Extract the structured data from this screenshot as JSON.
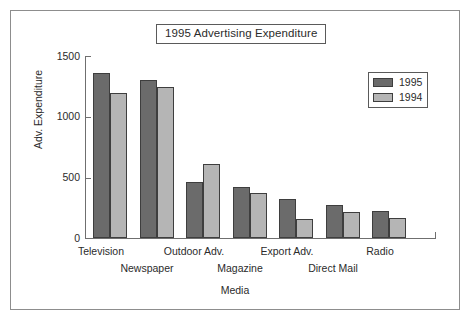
{
  "title": "1995 Advertising Expenditure",
  "legend": {
    "position": "top-right",
    "items": [
      {
        "label": "1995",
        "color": "#6b6b6b"
      },
      {
        "label": "1994",
        "color": "#b5b5b5"
      }
    ]
  },
  "axes": {
    "ylabel": "Adv. Expenditure",
    "xlabel": "Media",
    "yticks": [
      "0",
      "500",
      "1000",
      "1500"
    ]
  },
  "chart_data": {
    "type": "bar",
    "title": "1995 Advertising Expenditure",
    "xlabel": "Media",
    "ylabel": "Adv. Expenditure",
    "ylim": [
      0,
      1500
    ],
    "yticks": [
      0,
      500,
      1000,
      1500
    ],
    "grid": false,
    "legend_position": "top-right",
    "categories": [
      "Television",
      "Newspaper",
      "Outdoor Adv.",
      "Magazine",
      "Export Adv.",
      "Direct Mail",
      "Radio"
    ],
    "series": [
      {
        "name": "1995",
        "color": "#6b6b6b",
        "values": [
          1365,
          1310,
          465,
          420,
          320,
          275,
          225
        ]
      },
      {
        "name": "1994",
        "color": "#b5b5b5",
        "values": [
          1205,
          1255,
          610,
          370,
          160,
          215,
          165
        ]
      }
    ]
  }
}
